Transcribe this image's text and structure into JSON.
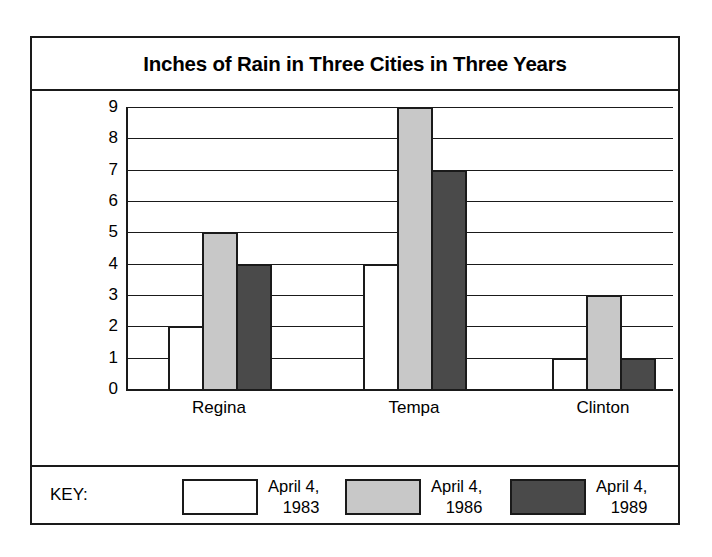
{
  "chart_data": {
    "type": "bar",
    "title": "Inches of Rain in Three Cities in Three Years",
    "xlabel": "",
    "ylabel": "",
    "ylim": [
      0,
      9
    ],
    "yticks": [
      "0",
      "1",
      "2",
      "3",
      "4",
      "5",
      "6",
      "7",
      "8",
      "9"
    ],
    "grid": true,
    "legend_position": "bottom",
    "legend_title": "KEY:",
    "categories": [
      "Regina",
      "Tempa",
      "Clinton"
    ],
    "series": [
      {
        "name": "April 4, 1983",
        "name_line1": "April 4,",
        "name_line2": "1983",
        "color": "#ffffff",
        "swatch": "white",
        "values": [
          2,
          4,
          1
        ]
      },
      {
        "name": "April 4, 1986",
        "name_line1": "April 4,",
        "name_line2": "1986",
        "color": "#c8c8c8",
        "swatch": "lightgray",
        "values": [
          5,
          9,
          3
        ]
      },
      {
        "name": "April 4, 1989",
        "name_line1": "April 4,",
        "name_line2": "1989",
        "color": "#4a4a4a",
        "swatch": "darkgray",
        "values": [
          4,
          7,
          1
        ]
      }
    ]
  }
}
